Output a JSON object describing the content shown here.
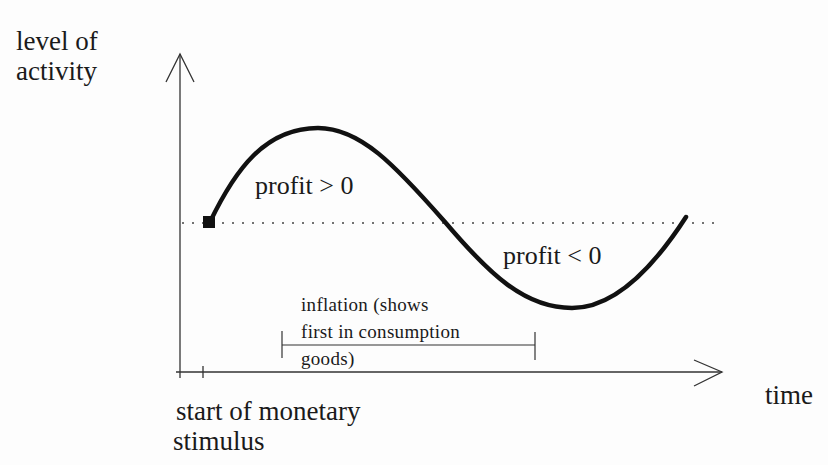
{
  "diagram": {
    "y_axis": {
      "label_line1": "level of",
      "label_line2": "activity"
    },
    "x_axis": {
      "label": "time"
    },
    "start_marker": {
      "label_line1": "start of monetary",
      "label_line2": "stimulus"
    },
    "regions": {
      "above": "profit > 0",
      "below": "profit < 0"
    },
    "inflation_bracket": {
      "line1": "inflation (shows",
      "line2": "first in consumption",
      "line3": "goods)"
    },
    "colors": {
      "ink": "#1a1a1a",
      "axis": "#333333",
      "background": "#fdfdfd"
    }
  }
}
